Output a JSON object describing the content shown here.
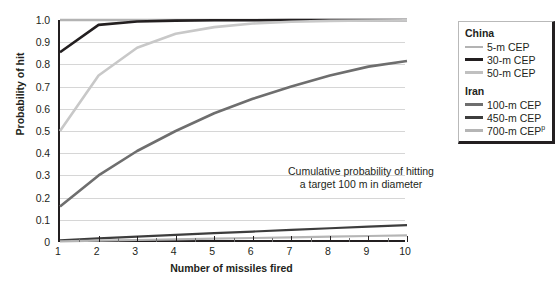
{
  "chart_data": {
    "type": "line",
    "title": "",
    "annotation": [
      "Cumulative probability of hitting",
      "a target 100 m in diameter"
    ],
    "xlabel": "Number of missiles fired",
    "ylabel": "Probability of hit",
    "xlim": [
      1,
      10
    ],
    "ylim": [
      0,
      1.0
    ],
    "grid": true,
    "legend_position": "right",
    "x": [
      1,
      2,
      3,
      4,
      5,
      6,
      7,
      8,
      9,
      10
    ],
    "xticks": [
      "1",
      "2",
      "3",
      "4",
      "5",
      "6",
      "7",
      "8",
      "9",
      "10"
    ],
    "yticks": [
      "0",
      "0.1",
      "0.2",
      "0.3",
      "0.4",
      "0.5",
      "0.6",
      "0.7",
      "0.8",
      "0.9",
      "1.0"
    ],
    "series": [
      {
        "name": "5-m CEP",
        "group": "China",
        "color": "#b3b3b3",
        "width": 2.4,
        "values": [
          1.0,
          1.0,
          1.0,
          1.0,
          1.0,
          1.0,
          1.0,
          1.0,
          1.0,
          1.0
        ]
      },
      {
        "name": "30-m CEP",
        "group": "China",
        "color": "#231f20",
        "width": 2.6,
        "values": [
          0.855,
          0.978,
          0.993,
          0.997,
          0.999,
          0.999,
          1.0,
          1.0,
          1.0,
          1.0
        ]
      },
      {
        "name": "50-m CEP",
        "group": "China",
        "color": "#c8c8c8",
        "width": 2.6,
        "values": [
          0.5,
          0.75,
          0.875,
          0.938,
          0.968,
          0.984,
          0.992,
          0.996,
          0.998,
          0.999
        ]
      },
      {
        "name": "100-m CEP",
        "group": "Iran",
        "color": "#6e6e6e",
        "width": 2.6,
        "values": [
          0.16,
          0.3,
          0.41,
          0.5,
          0.58,
          0.645,
          0.7,
          0.75,
          0.79,
          0.815
        ]
      },
      {
        "name": "450-m CEP",
        "group": "Iran",
        "color": "#3d3d3d",
        "width": 2.2,
        "values": [
          0.008,
          0.016,
          0.024,
          0.032,
          0.04,
          0.047,
          0.055,
          0.062,
          0.069,
          0.076
        ]
      },
      {
        "name": "700-m CEP",
        "group": "Iran",
        "color": "#b5b5b5",
        "width": 2.2,
        "values": [
          0.003,
          0.006,
          0.009,
          0.012,
          0.015,
          0.018,
          0.021,
          0.024,
          0.027,
          0.03
        ]
      }
    ]
  },
  "legend": {
    "groups": [
      {
        "title": "China",
        "entries": [
          {
            "label": "5-m CEP",
            "color": "#b3b3b3",
            "thickness": 2
          },
          {
            "label": "30-m CEP",
            "color": "#231f20",
            "thickness": 3
          },
          {
            "label": "50-m CEP",
            "color": "#c0c0c0",
            "thickness": 3
          }
        ]
      },
      {
        "title": "Iran",
        "entries": [
          {
            "label": "100-m CEP",
            "color": "#6e6e6e",
            "thickness": 3
          },
          {
            "label": "450-m CEP",
            "color": "#3d3d3d",
            "thickness": 3
          },
          {
            "label": "700-m CEP",
            "superscript": "p",
            "color": "#b5b5b5",
            "thickness": 3
          }
        ]
      }
    ]
  },
  "caption": ""
}
